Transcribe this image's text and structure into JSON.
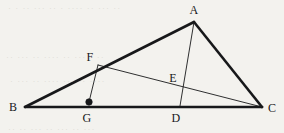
{
  "figure": {
    "caption": "Triangle ABC with cevian AD, segment FC and perpendicular FG",
    "background_color": "#f3f2ee",
    "ink_color": "#17181a",
    "thick_stroke_width": 2.6,
    "thin_stroke_width": 0.9,
    "width": 284,
    "height": 133
  },
  "points": {
    "A": {
      "label": "A",
      "x": 194,
      "y": 22,
      "label_x": 194,
      "label_y": 10
    },
    "B": {
      "label": "B",
      "x": 25,
      "y": 107,
      "label_x": 13,
      "label_y": 107
    },
    "C": {
      "label": "C",
      "x": 262,
      "y": 107,
      "label_x": 272,
      "label_y": 108
    },
    "D": {
      "label": "D",
      "x": 180,
      "y": 106,
      "label_x": 176,
      "label_y": 118
    },
    "E": {
      "label": "E",
      "x": 178,
      "y": 88,
      "label_x": 173,
      "label_y": 78
    },
    "F": {
      "label": "F",
      "x": 98,
      "y": 65,
      "label_x": 90,
      "label_y": 57
    },
    "G": {
      "label": "G",
      "x": 89,
      "y": 102,
      "label_x": 87,
      "label_y": 118
    }
  },
  "marked_points": [
    {
      "name": "G",
      "x": 89,
      "y": 102,
      "radius": 3.2,
      "filled": true
    }
  ],
  "segments": [
    {
      "name": "side-BC",
      "from": "B",
      "to": "C",
      "x1": 25,
      "y1": 107,
      "x2": 262,
      "y2": 107,
      "weight": "thick"
    },
    {
      "name": "side-BA",
      "from": "B",
      "to": "A",
      "x1": 25,
      "y1": 107,
      "x2": 194,
      "y2": 22,
      "weight": "thick"
    },
    {
      "name": "side-AC",
      "from": "A",
      "to": "C",
      "x1": 194,
      "y1": 22,
      "x2": 262,
      "y2": 107,
      "weight": "thick"
    },
    {
      "name": "cevian-AD",
      "from": "A",
      "to": "D",
      "x1": 194,
      "y1": 22,
      "x2": 180,
      "y2": 106,
      "weight": "thin"
    },
    {
      "name": "segment-FC",
      "from": "F",
      "to": "C",
      "x1": 98,
      "y1": 65,
      "x2": 262,
      "y2": 107,
      "weight": "thin"
    },
    {
      "name": "segment-FG",
      "from": "F",
      "to": "G",
      "x1": 98,
      "y1": 65,
      "x2": 89,
      "y2": 102,
      "weight": "thin"
    }
  ],
  "labels": [
    {
      "name": "label-A",
      "text": "A"
    },
    {
      "name": "label-B",
      "text": "B"
    },
    {
      "name": "label-C",
      "text": "C"
    },
    {
      "name": "label-D",
      "text": "D"
    },
    {
      "name": "label-E",
      "text": "E"
    },
    {
      "name": "label-F",
      "text": "F"
    },
    {
      "name": "label-G",
      "text": "G"
    }
  ],
  "scan_artifacts": [
    {
      "text": "· · ·· ··· ·· · ···· ·· ··· ··",
      "x": 8,
      "y": 3,
      "size": 9
    },
    {
      "text": "·· ··· ·· ···· ·· ··· · ··",
      "x": 6,
      "y": 52,
      "size": 9
    },
    {
      "text": "· ··· ·· ···· ··· ·· ····",
      "x": 10,
      "y": 76,
      "size": 9
    },
    {
      "text": "·· ·· ··· ·· ··· ·· ···",
      "x": 8,
      "y": 124,
      "size": 9
    }
  ]
}
